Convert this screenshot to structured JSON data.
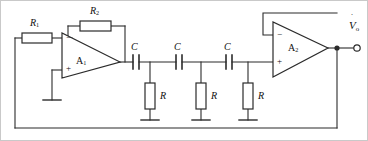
{
  "figure": {
    "kind": "circuit-schematic",
    "title": "",
    "stroke_color": "#2b2b2b",
    "fill_color": "#ffffff",
    "text_color": "#111111",
    "border_color": "#b9b9b9",
    "width": 368,
    "height": 141
  },
  "labels": {
    "r1": {
      "base": "R",
      "sub": "1"
    },
    "r2": {
      "base": "R",
      "sub": "2"
    },
    "c1": {
      "base": "C",
      "sub": ""
    },
    "c2": {
      "base": "C",
      "sub": ""
    },
    "c3": {
      "base": "C",
      "sub": ""
    },
    "rshunt1": {
      "base": "R",
      "sub": ""
    },
    "rshunt2": {
      "base": "R",
      "sub": ""
    },
    "rshunt3": {
      "base": "R",
      "sub": ""
    },
    "amp1": {
      "base": "A",
      "sub": "1"
    },
    "amp2": {
      "base": "A",
      "sub": "2"
    },
    "output": {
      "base": "V",
      "sub": "o"
    },
    "a1_minus": "−",
    "a1_plus": "+",
    "a2_minus": "−",
    "a2_plus": "+"
  },
  "components": [
    {
      "id": "r1",
      "type": "resistor",
      "orientation": "horizontal",
      "label": "R1",
      "x": 22,
      "y": 33,
      "w": 30,
      "h": 10
    },
    {
      "id": "r2",
      "type": "resistor",
      "orientation": "horizontal",
      "label": "R2",
      "x": 80,
      "y": 21,
      "w": 31,
      "h": 10
    },
    {
      "id": "c1",
      "type": "capacitor",
      "orientation": "horizontal",
      "label": "C",
      "x": 133,
      "y": 55,
      "w": 6,
      "h": 14
    },
    {
      "id": "c2",
      "type": "capacitor",
      "orientation": "horizontal",
      "label": "C",
      "x": 176,
      "y": 55,
      "w": 6,
      "h": 14
    },
    {
      "id": "c3",
      "type": "capacitor",
      "orientation": "horizontal",
      "label": "C",
      "x": 226,
      "y": 55,
      "w": 6,
      "h": 14
    },
    {
      "id": "rs1",
      "type": "resistor",
      "orientation": "vertical",
      "label": "R",
      "x": 145,
      "y": 83,
      "w": 10,
      "h": 26
    },
    {
      "id": "rs2",
      "type": "resistor",
      "orientation": "vertical",
      "label": "R",
      "x": 196,
      "y": 83,
      "w": 10,
      "h": 26
    },
    {
      "id": "rs3",
      "type": "resistor",
      "orientation": "vertical",
      "label": "R",
      "x": 243,
      "y": 83,
      "w": 10,
      "h": 26
    },
    {
      "id": "a1",
      "type": "opamp",
      "label": "A1",
      "x": 62,
      "y": 33,
      "w": 58,
      "h": 45
    },
    {
      "id": "a2",
      "type": "opamp",
      "label": "A2",
      "x": 273,
      "y": 22,
      "w": 55,
      "h": 55
    }
  ],
  "nodes": [
    {
      "id": "a1-out-node",
      "x": 120,
      "y": 62,
      "dot": false
    },
    {
      "id": "node-rc-1",
      "x": 150,
      "y": 62,
      "dot": false
    },
    {
      "id": "node-rc-2",
      "x": 201,
      "y": 62,
      "dot": false
    },
    {
      "id": "node-rc-3",
      "x": 248,
      "y": 62,
      "dot": false
    },
    {
      "id": "out-node",
      "x": 337,
      "y": 48,
      "dot": true
    }
  ],
  "terminals": [
    {
      "id": "vo-terminal",
      "x": 357,
      "y": 48,
      "r": 3.2,
      "label": "Vo"
    }
  ],
  "grounds": [
    {
      "id": "gnd-a1-plus",
      "x": 52,
      "y": 100
    },
    {
      "id": "gnd-rs1",
      "x": 150,
      "y": 120
    },
    {
      "id": "gnd-rs2",
      "x": 201,
      "y": 120
    },
    {
      "id": "gnd-rs3",
      "x": 248,
      "y": 120
    }
  ],
  "wires": [
    {
      "id": "w-left-rail",
      "points": "15,38 15,128"
    },
    {
      "id": "w-bottom-rail",
      "points": "15,128 337,128"
    },
    {
      "id": "w-out-down",
      "points": "337,48 337,128"
    },
    {
      "id": "w-r1-left",
      "points": "15,38 22,38"
    },
    {
      "id": "w-r1-right",
      "points": "52,38 72,38"
    },
    {
      "id": "w-r2-left",
      "points": "80,26 68,26"
    },
    {
      "id": "w-r2-tap-down",
      "points": "68,26 68,38"
    },
    {
      "id": "w-r2-right",
      "points": "111,26 125,26"
    },
    {
      "id": "w-r2-down",
      "points": "125,26 125,62"
    },
    {
      "id": "w-a1-out",
      "points": "120,62 133,62"
    },
    {
      "id": "w-a1-plus",
      "points": "62,70 52,70"
    },
    {
      "id": "w-a1-plus-gnd",
      "points": "52,70 52,100"
    },
    {
      "id": "w-c1-rs1",
      "points": "139,62 176,62"
    },
    {
      "id": "w-c2-rs2",
      "points": "182,62 226,62"
    },
    {
      "id": "w-c3-a2",
      "points": "232,62 273,62"
    },
    {
      "id": "w-rs1-stub-top",
      "points": "150,62 150,83"
    },
    {
      "id": "w-rs2-stub-top",
      "points": "201,62 201,83"
    },
    {
      "id": "w-rs3-stub-top",
      "points": "248,62 248,83"
    },
    {
      "id": "w-rs1-stub-bot",
      "points": "150,109 150,120"
    },
    {
      "id": "w-rs2-stub-bot",
      "points": "201,109 201,120"
    },
    {
      "id": "w-rs3-stub-bot",
      "points": "248,109 248,120"
    },
    {
      "id": "w-a2-fb-left",
      "points": "273,35 263,35"
    },
    {
      "id": "w-a2-fb-up",
      "points": "263,35 263,13"
    },
    {
      "id": "w-a2-fb-right",
      "points": "263,13 337,13"
    },
    {
      "id": "w-a2-out",
      "points": "328,48 357,48"
    }
  ]
}
